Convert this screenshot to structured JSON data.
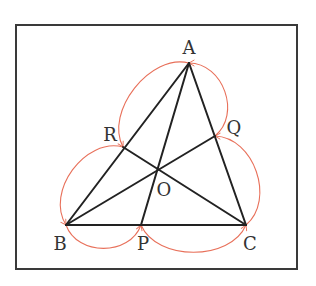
{
  "diagram": {
    "type": "triangle-cevians",
    "frame": {
      "x": 16,
      "y": 25,
      "width": 281,
      "height": 244,
      "stroke": "#3a3a3a"
    },
    "colors": {
      "line": "#222222",
      "arc": "#e8705a",
      "label": "#333333"
    },
    "points": {
      "A": {
        "label": "A",
        "x": 189,
        "y": 63,
        "lx": 189,
        "ly": 54
      },
      "B": {
        "label": "B",
        "x": 66,
        "y": 225,
        "lx": 60,
        "ly": 250
      },
      "C": {
        "label": "C",
        "x": 246,
        "y": 225,
        "lx": 250,
        "ly": 250
      },
      "P": {
        "label": "P",
        "x": 141,
        "y": 225,
        "lx": 143,
        "ly": 250
      },
      "Q": {
        "label": "Q",
        "x": 215,
        "y": 136,
        "lx": 234,
        "ly": 134
      },
      "R": {
        "label": "R",
        "x": 123,
        "y": 147,
        "lx": 110,
        "ly": 141
      },
      "O": {
        "label": "O",
        "x": 158,
        "y": 169,
        "lx": 164,
        "ly": 196
      }
    },
    "segments": [
      [
        "A",
        "B"
      ],
      [
        "B",
        "C"
      ],
      [
        "C",
        "A"
      ],
      [
        "A",
        "P"
      ],
      [
        "B",
        "Q"
      ],
      [
        "C",
        "R"
      ]
    ],
    "arcs": [
      {
        "name": "arc-A-R",
        "from": "A",
        "to": "R",
        "side": "outer-left"
      },
      {
        "name": "arc-R-B",
        "from": "R",
        "to": "B",
        "side": "outer-left"
      },
      {
        "name": "arc-B-P",
        "from": "B",
        "to": "P",
        "side": "below"
      },
      {
        "name": "arc-P-C",
        "from": "P",
        "to": "C",
        "side": "below"
      },
      {
        "name": "arc-C-Q",
        "from": "C",
        "to": "Q",
        "side": "outer-right"
      },
      {
        "name": "arc-Q-A",
        "from": "Q",
        "to": "A",
        "side": "outer-right"
      }
    ]
  }
}
